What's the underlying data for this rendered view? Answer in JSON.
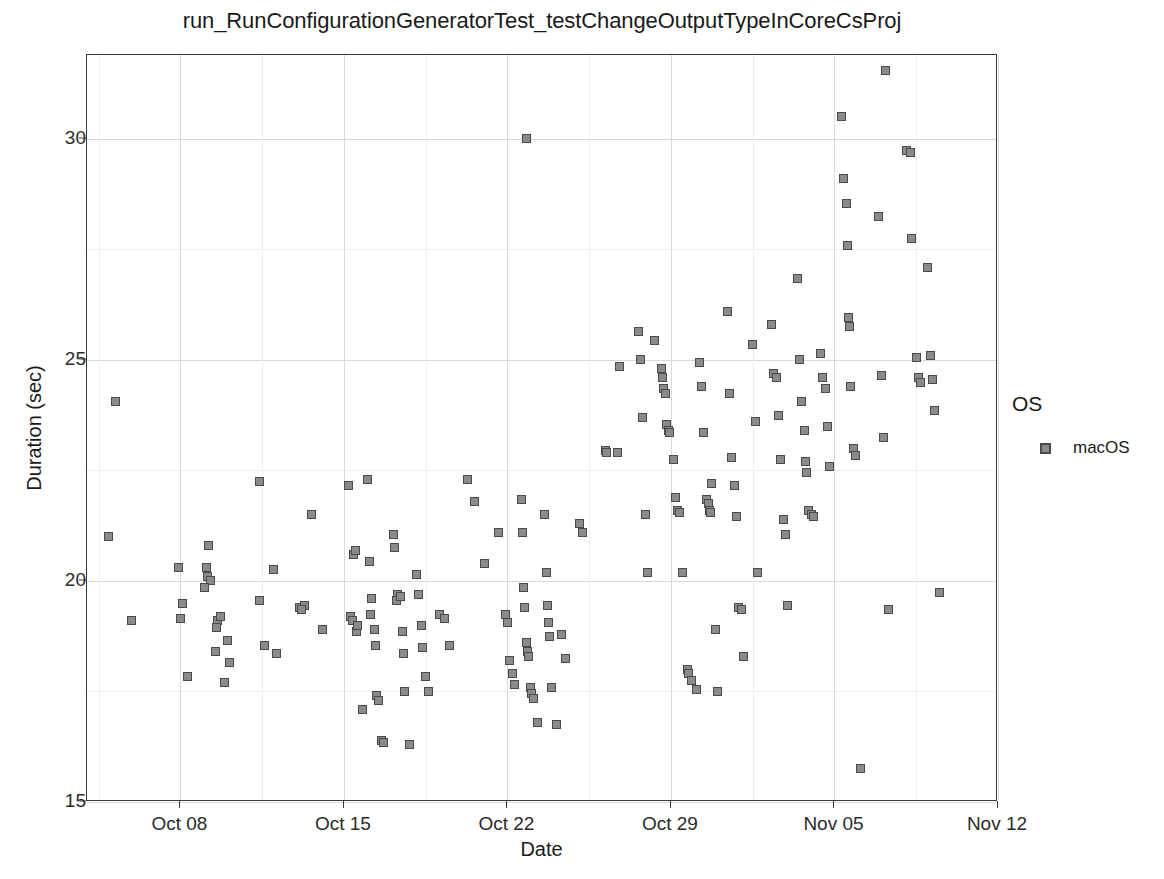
{
  "chart_data": {
    "type": "scatter",
    "title": "run_RunConfigurationGeneratorTest_testChangeOutputTypeInCoreCsProj",
    "xlabel": "Date",
    "ylabel": "Duration (sec)",
    "xlim": [
      "Oct 04",
      "Nov 12"
    ],
    "ylim": [
      15,
      31.9
    ],
    "grid": true,
    "y_ticks": [
      15,
      20,
      25,
      30
    ],
    "y_tick_labels": [
      "15",
      "20",
      "25",
      "30"
    ],
    "y_minor_ticks": [
      17.5,
      22.5,
      27.5
    ],
    "x_ticks": [
      "Oct 08",
      "Oct 15",
      "Oct 22",
      "Oct 29",
      "Nov 05",
      "Nov 12"
    ],
    "x_tick_days": [
      4,
      11,
      18,
      25,
      32,
      39
    ],
    "x_minor_tick_days": [
      0.5,
      7.5,
      14.5,
      21.5,
      28.5,
      35.5
    ],
    "x_day_range": [
      0,
      39
    ],
    "legend": {
      "position": "right",
      "title": "OS",
      "entries": [
        {
          "label": "macOS",
          "marker": "square",
          "fill": "#8a8a8a",
          "stroke": "#4a4a4a"
        }
      ]
    },
    "series": [
      {
        "name": "macOS",
        "marker": "square",
        "fill": "#8a8a8a",
        "stroke": "#4a4a4a",
        "points": [
          {
            "day": 1.2,
            "value": 24.05
          },
          {
            "day": 0.9,
            "value": 21.0
          },
          {
            "day": 1.9,
            "value": 19.1
          },
          {
            "day": 3.9,
            "value": 20.3
          },
          {
            "day": 4.1,
            "value": 19.5
          },
          {
            "day": 4.0,
            "value": 19.15
          },
          {
            "day": 4.3,
            "value": 17.85
          },
          {
            "day": 5.2,
            "value": 20.8
          },
          {
            "day": 5.1,
            "value": 20.3
          },
          {
            "day": 5.15,
            "value": 20.1
          },
          {
            "day": 5.3,
            "value": 20.0
          },
          {
            "day": 5.05,
            "value": 19.85
          },
          {
            "day": 5.6,
            "value": 19.1
          },
          {
            "day": 5.55,
            "value": 18.95
          },
          {
            "day": 5.7,
            "value": 19.2
          },
          {
            "day": 5.5,
            "value": 18.4
          },
          {
            "day": 5.9,
            "value": 17.7
          },
          {
            "day": 6.0,
            "value": 18.65
          },
          {
            "day": 6.1,
            "value": 18.15
          },
          {
            "day": 7.4,
            "value": 22.25
          },
          {
            "day": 7.4,
            "value": 19.55
          },
          {
            "day": 7.6,
            "value": 18.55
          },
          {
            "day": 8.1,
            "value": 18.35
          },
          {
            "day": 8.0,
            "value": 20.25
          },
          {
            "day": 9.1,
            "value": 19.4
          },
          {
            "day": 9.3,
            "value": 19.45
          },
          {
            "day": 9.2,
            "value": 19.35
          },
          {
            "day": 9.6,
            "value": 21.5
          },
          {
            "day": 10.1,
            "value": 18.9
          },
          {
            "day": 11.2,
            "value": 22.15
          },
          {
            "day": 11.4,
            "value": 20.6
          },
          {
            "day": 11.5,
            "value": 20.7
          },
          {
            "day": 11.3,
            "value": 19.2
          },
          {
            "day": 11.35,
            "value": 19.1
          },
          {
            "day": 11.55,
            "value": 18.85
          },
          {
            "day": 11.6,
            "value": 19.0
          },
          {
            "day": 11.8,
            "value": 17.1
          },
          {
            "day": 12.0,
            "value": 22.3
          },
          {
            "day": 12.1,
            "value": 20.45
          },
          {
            "day": 12.2,
            "value": 19.6
          },
          {
            "day": 12.15,
            "value": 19.25
          },
          {
            "day": 12.3,
            "value": 18.9
          },
          {
            "day": 12.35,
            "value": 18.55
          },
          {
            "day": 12.4,
            "value": 17.4
          },
          {
            "day": 12.5,
            "value": 17.3
          },
          {
            "day": 12.6,
            "value": 16.4
          },
          {
            "day": 12.7,
            "value": 16.35
          },
          {
            "day": 13.1,
            "value": 21.05
          },
          {
            "day": 13.15,
            "value": 20.75
          },
          {
            "day": 13.3,
            "value": 19.7
          },
          {
            "day": 13.25,
            "value": 19.55
          },
          {
            "day": 13.4,
            "value": 19.65
          },
          {
            "day": 13.5,
            "value": 18.85
          },
          {
            "day": 13.55,
            "value": 18.35
          },
          {
            "day": 13.6,
            "value": 17.5
          },
          {
            "day": 13.8,
            "value": 16.3
          },
          {
            "day": 14.1,
            "value": 20.15
          },
          {
            "day": 14.2,
            "value": 19.7
          },
          {
            "day": 14.3,
            "value": 19.0
          },
          {
            "day": 14.35,
            "value": 18.5
          },
          {
            "day": 14.5,
            "value": 17.85
          },
          {
            "day": 14.6,
            "value": 17.5
          },
          {
            "day": 15.1,
            "value": 19.25
          },
          {
            "day": 15.3,
            "value": 19.15
          },
          {
            "day": 15.5,
            "value": 18.55
          },
          {
            "day": 16.3,
            "value": 22.3
          },
          {
            "day": 16.6,
            "value": 21.8
          },
          {
            "day": 17.0,
            "value": 20.4
          },
          {
            "day": 17.6,
            "value": 21.1
          },
          {
            "day": 18.8,
            "value": 30.0
          },
          {
            "day": 17.9,
            "value": 19.25
          },
          {
            "day": 18.0,
            "value": 19.05
          },
          {
            "day": 18.1,
            "value": 18.2
          },
          {
            "day": 18.2,
            "value": 17.9
          },
          {
            "day": 18.3,
            "value": 17.65
          },
          {
            "day": 18.6,
            "value": 21.85
          },
          {
            "day": 18.65,
            "value": 21.1
          },
          {
            "day": 18.7,
            "value": 19.85
          },
          {
            "day": 18.75,
            "value": 19.4
          },
          {
            "day": 18.8,
            "value": 18.6
          },
          {
            "day": 18.85,
            "value": 18.4
          },
          {
            "day": 18.9,
            "value": 18.3
          },
          {
            "day": 19.0,
            "value": 17.6
          },
          {
            "day": 19.05,
            "value": 17.45
          },
          {
            "day": 19.1,
            "value": 17.35
          },
          {
            "day": 19.3,
            "value": 16.8
          },
          {
            "day": 19.6,
            "value": 21.5
          },
          {
            "day": 19.65,
            "value": 20.2
          },
          {
            "day": 19.7,
            "value": 19.45
          },
          {
            "day": 19.75,
            "value": 19.05
          },
          {
            "day": 19.8,
            "value": 18.75
          },
          {
            "day": 19.9,
            "value": 17.6
          },
          {
            "day": 20.1,
            "value": 16.75
          },
          {
            "day": 20.3,
            "value": 18.8
          },
          {
            "day": 20.5,
            "value": 18.25
          },
          {
            "day": 21.1,
            "value": 21.3
          },
          {
            "day": 21.2,
            "value": 21.1
          },
          {
            "day": 22.2,
            "value": 22.95
          },
          {
            "day": 22.25,
            "value": 22.9
          },
          {
            "day": 22.7,
            "value": 22.9
          },
          {
            "day": 22.8,
            "value": 24.85
          },
          {
            "day": 23.6,
            "value": 25.65
          },
          {
            "day": 23.7,
            "value": 25.0
          },
          {
            "day": 23.8,
            "value": 23.7
          },
          {
            "day": 23.9,
            "value": 21.5
          },
          {
            "day": 24.0,
            "value": 20.2
          },
          {
            "day": 24.3,
            "value": 25.45
          },
          {
            "day": 24.6,
            "value": 24.8
          },
          {
            "day": 24.65,
            "value": 24.6
          },
          {
            "day": 24.7,
            "value": 24.35
          },
          {
            "day": 24.75,
            "value": 24.25
          },
          {
            "day": 24.8,
            "value": 23.55
          },
          {
            "day": 24.9,
            "value": 23.4
          },
          {
            "day": 24.95,
            "value": 23.35
          },
          {
            "day": 25.1,
            "value": 22.75
          },
          {
            "day": 25.2,
            "value": 21.9
          },
          {
            "day": 25.3,
            "value": 21.6
          },
          {
            "day": 25.35,
            "value": 21.55
          },
          {
            "day": 25.5,
            "value": 20.2
          },
          {
            "day": 25.7,
            "value": 18.0
          },
          {
            "day": 25.75,
            "value": 17.9
          },
          {
            "day": 25.9,
            "value": 17.75
          },
          {
            "day": 26.1,
            "value": 17.55
          },
          {
            "day": 26.2,
            "value": 24.95
          },
          {
            "day": 26.3,
            "value": 24.4
          },
          {
            "day": 26.4,
            "value": 23.35
          },
          {
            "day": 26.5,
            "value": 21.85
          },
          {
            "day": 26.6,
            "value": 21.75
          },
          {
            "day": 26.65,
            "value": 21.6
          },
          {
            "day": 26.7,
            "value": 21.55
          },
          {
            "day": 26.75,
            "value": 22.2
          },
          {
            "day": 26.9,
            "value": 18.9
          },
          {
            "day": 27.0,
            "value": 17.5
          },
          {
            "day": 27.4,
            "value": 26.1
          },
          {
            "day": 27.5,
            "value": 24.25
          },
          {
            "day": 27.6,
            "value": 22.8
          },
          {
            "day": 27.7,
            "value": 22.15
          },
          {
            "day": 27.8,
            "value": 21.45
          },
          {
            "day": 27.9,
            "value": 19.4
          },
          {
            "day": 28.0,
            "value": 19.35
          },
          {
            "day": 28.1,
            "value": 18.3
          },
          {
            "day": 28.5,
            "value": 25.35
          },
          {
            "day": 28.6,
            "value": 23.6
          },
          {
            "day": 28.7,
            "value": 20.2
          },
          {
            "day": 29.3,
            "value": 25.8
          },
          {
            "day": 29.4,
            "value": 24.7
          },
          {
            "day": 29.5,
            "value": 24.6
          },
          {
            "day": 29.6,
            "value": 23.75
          },
          {
            "day": 29.7,
            "value": 22.75
          },
          {
            "day": 29.8,
            "value": 21.4
          },
          {
            "day": 29.9,
            "value": 21.05
          },
          {
            "day": 30.0,
            "value": 19.45
          },
          {
            "day": 30.4,
            "value": 26.85
          },
          {
            "day": 30.5,
            "value": 25.0
          },
          {
            "day": 30.6,
            "value": 24.05
          },
          {
            "day": 30.7,
            "value": 23.4
          },
          {
            "day": 30.75,
            "value": 22.7
          },
          {
            "day": 30.8,
            "value": 22.45
          },
          {
            "day": 30.9,
            "value": 21.6
          },
          {
            "day": 31.0,
            "value": 21.5
          },
          {
            "day": 31.1,
            "value": 21.45
          },
          {
            "day": 31.4,
            "value": 25.15
          },
          {
            "day": 31.5,
            "value": 24.6
          },
          {
            "day": 31.6,
            "value": 24.35
          },
          {
            "day": 31.7,
            "value": 23.5
          },
          {
            "day": 31.8,
            "value": 22.6
          },
          {
            "day": 32.4,
            "value": 29.1
          },
          {
            "day": 32.5,
            "value": 28.55
          },
          {
            "day": 32.55,
            "value": 27.6
          },
          {
            "day": 32.6,
            "value": 25.95
          },
          {
            "day": 32.65,
            "value": 25.75
          },
          {
            "day": 32.7,
            "value": 24.4
          },
          {
            "day": 32.8,
            "value": 23.0
          },
          {
            "day": 32.9,
            "value": 22.85
          },
          {
            "day": 32.3,
            "value": 30.5
          },
          {
            "day": 33.1,
            "value": 15.75
          },
          {
            "day": 33.9,
            "value": 28.25
          },
          {
            "day": 34.2,
            "value": 31.55
          },
          {
            "day": 34.0,
            "value": 24.65
          },
          {
            "day": 34.1,
            "value": 23.25
          },
          {
            "day": 34.3,
            "value": 19.35
          },
          {
            "day": 35.1,
            "value": 29.75
          },
          {
            "day": 35.25,
            "value": 29.7
          },
          {
            "day": 35.3,
            "value": 27.75
          },
          {
            "day": 35.5,
            "value": 25.05
          },
          {
            "day": 35.6,
            "value": 24.6
          },
          {
            "day": 35.7,
            "value": 24.5
          },
          {
            "day": 36.0,
            "value": 27.1
          },
          {
            "day": 36.1,
            "value": 25.1
          },
          {
            "day": 36.2,
            "value": 24.55
          },
          {
            "day": 36.3,
            "value": 23.85
          },
          {
            "day": 36.5,
            "value": 19.75
          }
        ]
      }
    ]
  }
}
